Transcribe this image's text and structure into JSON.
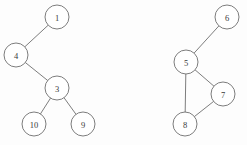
{
  "figure": {
    "title": "",
    "background_color": "#fdfdfd",
    "stroke_color": "#6e6e6e",
    "node_fill_color": "#ffffff",
    "label_color": "#3a3a3a",
    "node_radius": 12
  },
  "chart_data": {
    "type": "diagram",
    "diagram_type": "undirected-graph",
    "title": "",
    "xlabel": "",
    "ylabel": "",
    "grid": false,
    "legend": null,
    "components": [
      {
        "name": "left-graph",
        "kind": "tree",
        "nodes": [
          {
            "id": "1",
            "label": "1",
            "x": 57,
            "y": 17
          },
          {
            "id": "4",
            "label": "4",
            "x": 16,
            "y": 55
          },
          {
            "id": "3",
            "label": "3",
            "x": 57,
            "y": 88
          },
          {
            "id": "10",
            "label": "10",
            "x": 34,
            "y": 124
          },
          {
            "id": "9",
            "label": "9",
            "x": 83,
            "y": 124
          }
        ],
        "edges": [
          {
            "from": "1",
            "to": "4"
          },
          {
            "from": "4",
            "to": "3"
          },
          {
            "from": "3",
            "to": "10"
          },
          {
            "from": "3",
            "to": "9"
          }
        ]
      },
      {
        "name": "right-graph",
        "kind": "cyclic",
        "nodes": [
          {
            "id": "6",
            "label": "6",
            "x": 227,
            "y": 17
          },
          {
            "id": "5",
            "label": "5",
            "x": 186,
            "y": 62
          },
          {
            "id": "7",
            "label": "7",
            "x": 223,
            "y": 94
          },
          {
            "id": "8",
            "label": "8",
            "x": 185,
            "y": 124
          }
        ],
        "edges": [
          {
            "from": "6",
            "to": "5"
          },
          {
            "from": "5",
            "to": "7"
          },
          {
            "from": "5",
            "to": "8"
          },
          {
            "from": "7",
            "to": "8"
          }
        ]
      }
    ]
  }
}
